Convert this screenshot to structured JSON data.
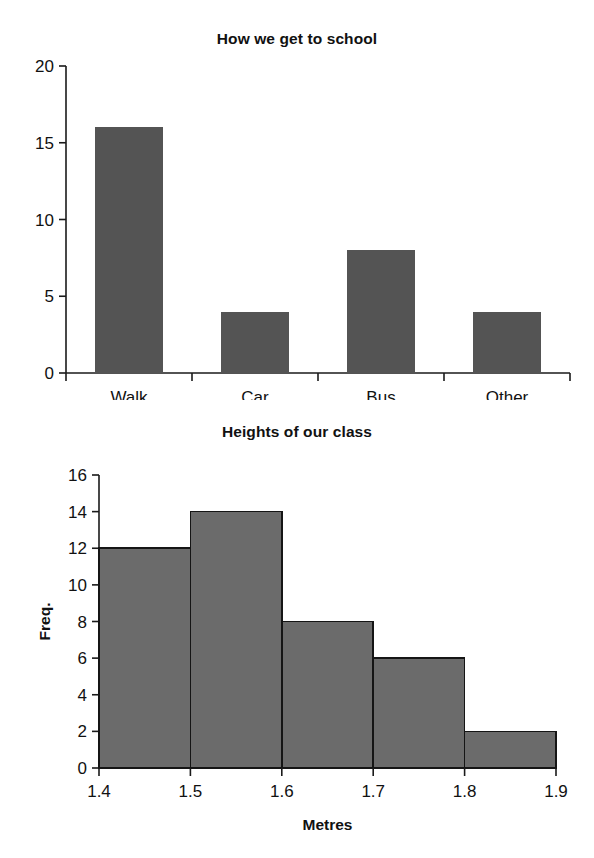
{
  "page": {
    "background": "#ffffff",
    "width": 594,
    "height": 858
  },
  "charts": [
    {
      "id": "how-we-get-to-school",
      "title": "How we get to school",
      "xlabel": "",
      "ylabel": ""
    },
    {
      "id": "heights-of-our-class",
      "title": "Heights of our class",
      "xlabel": "Metres",
      "ylabel": "Freq."
    }
  ],
  "chart_data": [
    {
      "type": "bar",
      "title": "How we get to school",
      "categories": [
        "Walk",
        "Car",
        "Bus",
        "Other"
      ],
      "values": [
        16,
        4,
        8,
        4
      ],
      "xlabel": "",
      "ylabel": "",
      "ylim": [
        0,
        20
      ],
      "yticks": [
        0,
        5,
        10,
        15,
        20
      ],
      "ytick_labels": [
        "0",
        "5",
        "10",
        "15",
        "20"
      ],
      "grid": false,
      "legend": false,
      "bar_color": "#545454",
      "bar_outline": "none"
    },
    {
      "type": "bar",
      "subtype": "histogram",
      "title": "Heights of our class",
      "categories": [
        "1.4-1.5",
        "1.5-1.6",
        "1.6-1.7",
        "1.7-1.8",
        "1.8-1.9"
      ],
      "bin_edges": [
        1.4,
        1.5,
        1.6,
        1.7,
        1.8,
        1.9
      ],
      "values": [
        12,
        14,
        8,
        6,
        2
      ],
      "xlabel": "Metres",
      "ylabel": "Freq.",
      "xlim": [
        1.4,
        1.9
      ],
      "ylim": [
        0,
        16
      ],
      "xticks": [
        1.4,
        1.5,
        1.6,
        1.7,
        1.8,
        1.9
      ],
      "xtick_labels": [
        "1.4",
        "1.5",
        "1.6",
        "1.7",
        "1.8",
        "1.9"
      ],
      "yticks": [
        0,
        2,
        4,
        6,
        8,
        10,
        12,
        14,
        16
      ],
      "ytick_labels": [
        "0",
        "2",
        "4",
        "6",
        "8",
        "10",
        "12",
        "14",
        "16"
      ],
      "grid": false,
      "legend": false,
      "bar_color": "#6b6b6b",
      "bar_outline": "#151515"
    }
  ]
}
